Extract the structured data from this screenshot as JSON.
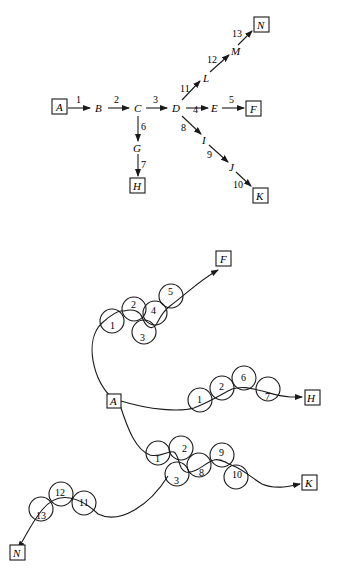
{
  "top_graph": {
    "nodes": {
      "A": "A",
      "B": "B",
      "C": "C",
      "D": "D",
      "E": "E",
      "F": "F",
      "G": "G",
      "H": "H",
      "I": "I",
      "J": "J",
      "K": "K",
      "L": "L",
      "M": "M",
      "N": "N"
    },
    "boxed_nodes": [
      "A",
      "F",
      "H",
      "K",
      "N"
    ],
    "edges": [
      {
        "label": "1",
        "from": "A",
        "to": "B"
      },
      {
        "label": "2",
        "from": "B",
        "to": "C"
      },
      {
        "label": "3",
        "from": "C",
        "to": "D"
      },
      {
        "label": "4",
        "from": "D",
        "to": "E"
      },
      {
        "label": "5",
        "from": "E",
        "to": "F"
      },
      {
        "label": "6",
        "from": "C",
        "to": "G"
      },
      {
        "label": "7",
        "from": "G",
        "to": "H"
      },
      {
        "label": "8",
        "from": "D",
        "to": "I"
      },
      {
        "label": "9",
        "from": "I",
        "to": "J"
      },
      {
        "label": "10",
        "from": "J",
        "to": "K"
      },
      {
        "label": "11",
        "from": "D",
        "to": "L"
      },
      {
        "label": "12",
        "from": "L",
        "to": "M"
      },
      {
        "label": "13",
        "from": "M",
        "to": "N"
      }
    ]
  },
  "bottom_graph": {
    "terminals": {
      "A": "A",
      "F": "F",
      "H": "H",
      "K": "K",
      "N": "N"
    },
    "path_F": [
      "1",
      "2",
      "3",
      "4",
      "5"
    ],
    "path_H": [
      "1",
      "2",
      "6",
      "7"
    ],
    "path_K": [
      "1",
      "2",
      "3",
      "8",
      "9",
      "10"
    ],
    "path_N": [
      "11",
      "12",
      "13"
    ]
  }
}
